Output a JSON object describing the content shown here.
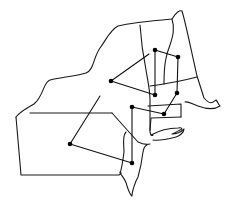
{
  "diagram": {
    "type": "map-network",
    "colors": {
      "background": "#ffffff",
      "stroke": "#1a1a1a",
      "node": "#000000"
    },
    "nodes": [
      {
        "id": "n1",
        "x": 155,
        "y": 50
      },
      {
        "id": "n2",
        "x": 178,
        "y": 57
      },
      {
        "id": "n3",
        "x": 111,
        "y": 81
      },
      {
        "id": "n4",
        "x": 155,
        "y": 95
      },
      {
        "id": "n5",
        "x": 177,
        "y": 93
      },
      {
        "id": "n6",
        "x": 132,
        "y": 107
      },
      {
        "id": "n7",
        "x": 164,
        "y": 114
      },
      {
        "id": "n8",
        "x": 70,
        "y": 144
      },
      {
        "id": "n9",
        "x": 132,
        "y": 163
      }
    ],
    "edges": [
      {
        "from": "n1",
        "to": "n2"
      },
      {
        "from": "n1",
        "to": "n4"
      },
      {
        "from": "n2",
        "to": "n5"
      },
      {
        "from": "n3",
        "to": "n4"
      },
      {
        "from": "n5",
        "to": "n7"
      },
      {
        "from": "n6",
        "to": "n7"
      },
      {
        "from": "n6",
        "to": "n9"
      },
      {
        "from": "n8",
        "to": "n9"
      }
    ],
    "open_edges": [
      {
        "x1": 111,
        "y1": 81,
        "x2": 149,
        "y2": 54
      },
      {
        "x1": 70,
        "y1": 144,
        "x2": 100,
        "y2": 96
      }
    ]
  }
}
